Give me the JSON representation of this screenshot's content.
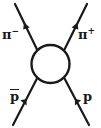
{
  "diagram": {
    "kind": "feynman-diagram",
    "background_color": "#ffffff",
    "stroke_color": "#1a1a1a",
    "line_width": 2.2,
    "blob": {
      "name": "interaction-blob",
      "shape": "circle",
      "cx": 50.5,
      "cy": 64,
      "r": 19,
      "fill": "none",
      "stroke": "#1a1a1a",
      "stroke_width": 2.4
    },
    "legs": [
      {
        "id": "pi-minus",
        "label_text": "π",
        "label_sup": "−",
        "overbar": false,
        "position": "top-left",
        "direction": "outgoing",
        "arrow_points": "up-left",
        "x1": 15,
        "y1": 4,
        "x2": 37,
        "y2": 50,
        "arrow_at_t": 0.42
      },
      {
        "id": "pi-plus",
        "label_text": "π",
        "label_sup": "+",
        "overbar": false,
        "position": "top-right",
        "direction": "outgoing",
        "arrow_points": "up-right",
        "x1": 87,
        "y1": 4,
        "x2": 64,
        "y2": 50,
        "arrow_at_t": 0.42
      },
      {
        "id": "p-bar",
        "label_text": "p",
        "label_sup": "",
        "overbar": true,
        "position": "bottom-left",
        "direction": "incoming",
        "arrow_points": "up-right",
        "x1": 13,
        "y1": 125,
        "x2": 37,
        "y2": 78,
        "arrow_at_t": 0.45
      },
      {
        "id": "p",
        "label_text": "p",
        "label_sup": "",
        "overbar": false,
        "position": "bottom-right",
        "direction": "incoming",
        "arrow_points": "up-left",
        "x1": 89,
        "y1": 125,
        "x2": 64,
        "y2": 78,
        "arrow_at_t": 0.45
      }
    ],
    "labels": {
      "pi_minus": "π",
      "pi_minus_sup": "−",
      "pi_plus": "π",
      "pi_plus_sup": "+",
      "p_bar": "p",
      "p": "p"
    }
  }
}
